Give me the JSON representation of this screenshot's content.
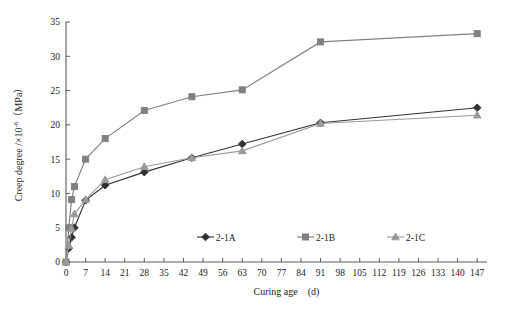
{
  "chart_data": {
    "type": "line",
    "title": "",
    "xlabel": "Curing age　(d)",
    "ylabel": "Creep degree /×10⁻⁶（MPa）",
    "ylabel_parts": {
      "main": "Creep degree /×10",
      "sup": "-6",
      "tail": "（MPa）"
    },
    "xlim": [
      0,
      150.5
    ],
    "ylim": [
      0,
      35
    ],
    "grid": false,
    "legend_position": "bottom-center",
    "xticks": [
      0,
      7,
      14,
      21,
      28,
      35,
      42,
      49,
      56,
      63,
      70,
      77,
      84,
      91,
      98,
      105,
      112,
      119,
      126,
      133,
      140,
      147
    ],
    "yticks": [
      0,
      5,
      10,
      15,
      20,
      25,
      30,
      35
    ],
    "series": [
      {
        "name": "2-1A",
        "marker": "diamond",
        "color": "#333333",
        "x": [
          0,
          1,
          2,
          3,
          7,
          14,
          28,
          45,
          63,
          91,
          147
        ],
        "values": [
          0,
          2.0,
          3.6,
          5.0,
          9.0,
          11.2,
          13.1,
          15.2,
          17.2,
          20.3,
          22.5
        ]
      },
      {
        "name": "2-1B",
        "marker": "square",
        "color": "#808080",
        "x": [
          0,
          1,
          2,
          3,
          7,
          14,
          28,
          45,
          63,
          91,
          147
        ],
        "values": [
          0,
          5.0,
          9.1,
          11.0,
          15.0,
          18.0,
          22.1,
          24.1,
          25.1,
          32.1,
          33.3
        ]
      },
      {
        "name": "2-1C",
        "marker": "triangle",
        "color": "#999999",
        "x": [
          0,
          1,
          2,
          3,
          7,
          14,
          28,
          45,
          63,
          91,
          147
        ],
        "values": [
          0,
          2.4,
          4.9,
          7.0,
          9.1,
          12.0,
          13.9,
          15.2,
          16.2,
          20.2,
          21.4
        ]
      }
    ]
  },
  "legend": {
    "items": [
      {
        "label": "2-1A"
      },
      {
        "label": "2-1B"
      },
      {
        "label": "2-1C"
      }
    ]
  }
}
